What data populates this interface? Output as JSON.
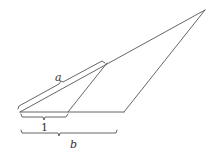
{
  "diagram": {
    "type": "geometry-figure",
    "stroke_color": "#555555",
    "label_color": "#333333",
    "points": {
      "left_vertex": [
        20,
        112
      ],
      "inner_base_point": [
        68,
        112
      ],
      "outer_base_point": [
        124,
        112
      ],
      "inner_top_point": [
        107,
        63
      ],
      "apex": [
        205,
        10
      ]
    },
    "labels": {
      "a": "a",
      "one": "1",
      "b": "b"
    }
  }
}
